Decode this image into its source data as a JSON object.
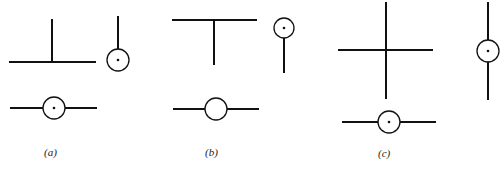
{
  "panels": [
    {
      "id": "a",
      "label": "(a)",
      "label_pos": [
        44,
        146
      ],
      "lines": [
        [
          9,
          62,
          96,
          62
        ],
        [
          52,
          19,
          52,
          62
        ],
        [
          118,
          16,
          118,
          50
        ],
        [
          10,
          108,
          43,
          108
        ],
        [
          65,
          108,
          97,
          108
        ]
      ],
      "circles": [
        {
          "cx": 118,
          "cy": 60,
          "r": 11,
          "dot": true
        },
        {
          "cx": 54,
          "cy": 108,
          "r": 11,
          "dot": true
        }
      ]
    },
    {
      "id": "b",
      "label": "(b)",
      "label_pos": [
        205,
        146
      ],
      "lines": [
        [
          172,
          20,
          257,
          20
        ],
        [
          214,
          20,
          214,
          65
        ],
        [
          284,
          38,
          284,
          73
        ],
        [
          173,
          109,
          259,
          109
        ]
      ],
      "circles": [
        {
          "cx": 284,
          "cy": 28,
          "r": 10,
          "dot": true
        },
        {
          "cx": 216,
          "cy": 109,
          "r": 11,
          "dot": false
        }
      ]
    },
    {
      "id": "c",
      "label": "(c)",
      "label_pos": [
        378,
        147
      ],
      "lines": [
        [
          386,
          2,
          386,
          99
        ],
        [
          338,
          50,
          433,
          50
        ],
        [
          488,
          2,
          488,
          100
        ],
        [
          342,
          122,
          436,
          122
        ]
      ],
      "circles": [
        {
          "cx": 488,
          "cy": 51,
          "r": 11,
          "dot": true
        },
        {
          "cx": 389,
          "cy": 122,
          "r": 11,
          "dot": true
        }
      ]
    }
  ]
}
